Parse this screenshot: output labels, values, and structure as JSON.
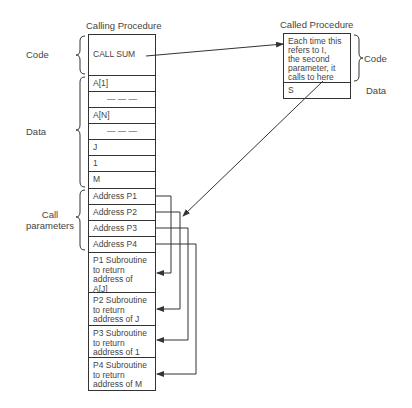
{
  "calling_procedure": {
    "title": "Calling Procedure",
    "code_label": "Code",
    "data_label": "Data",
    "call_params_label": "Call\nparameters",
    "code_cell": "CALL SUM",
    "data_cells": [
      "A[1]",
      "— — —",
      "A[N]",
      "— — —",
      "J",
      "1",
      "M"
    ],
    "param_cells": [
      "Address P1",
      "Address P2",
      "Address P3",
      "Address P4"
    ],
    "subroutine_cells": [
      "P1 Subroutine\nto return\naddress of\nA[J]",
      "P2 Subroutine\nto return\naddress of J",
      "P3 Subroutine\nto return\naddress of 1",
      "P4 Subroutine\nto return\naddress of M"
    ]
  },
  "called_procedure": {
    "title": "Called Procedure",
    "code_label": "Code",
    "data_label": "Data",
    "code_cell": "Each time this\nrefers to I,\nthe second\nparameter, it\ncalls to here",
    "data_cell": "S"
  },
  "colors": {
    "line": "#333333",
    "text": "#444444",
    "background": "#ffffff"
  }
}
